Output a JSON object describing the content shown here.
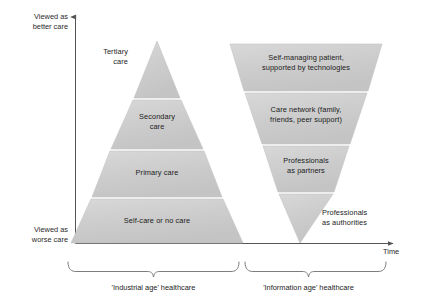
{
  "figure": {
    "axes": {
      "y_top_label": "Viewed as\nbetter care",
      "y_bottom_label": "Viewed as\nworse care",
      "x_label": "Time"
    },
    "colors": {
      "shape_fill": "#cccccc",
      "shape_fill_light": "#d6d6d6",
      "shape_stroke": "#bdbdbd",
      "text": "#1b1b1b",
      "axis": "#555555",
      "background": "#ffffff"
    },
    "brackets": [
      {
        "name": "industrial",
        "label": "'Industrial age' healthcare"
      },
      {
        "name": "information",
        "label": "'Information age' healthcare"
      }
    ],
    "pyramid": {
      "name": "industrial-age-pyramid",
      "orientation": "upright",
      "layers": [
        {
          "label": "Tertiary\ncare",
          "label_position": "outside-left"
        },
        {
          "label": "Secondary\ncare",
          "label_position": "inside"
        },
        {
          "label": "Primary care",
          "label_position": "inside"
        },
        {
          "label": "Self-care or no care",
          "label_position": "inside"
        }
      ]
    },
    "inverted_pyramid": {
      "name": "information-age-inverted-pyramid",
      "orientation": "inverted",
      "layers": [
        {
          "label": "Self-managing patient,\nsupported by technologies",
          "label_position": "inside"
        },
        {
          "label": "Care network (family,\nfriends, peer support)",
          "label_position": "inside"
        },
        {
          "label": "Professionals\nas partners",
          "label_position": "inside"
        },
        {
          "label": "Professionals\nas authorities",
          "label_position": "outside-right"
        }
      ]
    }
  }
}
